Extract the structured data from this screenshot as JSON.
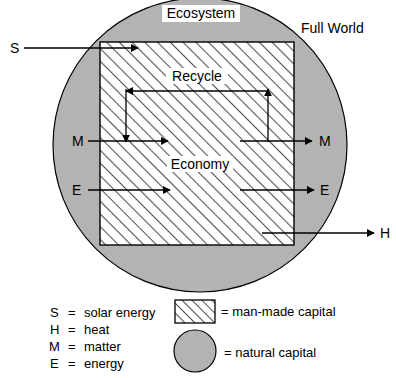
{
  "figure": {
    "labels": {
      "ecosystem": "Ecosystem",
      "full_world": "Full World",
      "recycle": "Recycle",
      "economy": "Economy"
    },
    "flows": [
      {
        "id": "solar",
        "symbol": "S",
        "side": "left-in"
      },
      {
        "id": "matter-in",
        "symbol": "M",
        "side": "left-in"
      },
      {
        "id": "matter-out",
        "symbol": "M",
        "side": "right-out"
      },
      {
        "id": "energy-in",
        "symbol": "E",
        "side": "left-in"
      },
      {
        "id": "energy-out",
        "symbol": "E",
        "side": "right-out"
      },
      {
        "id": "heat",
        "symbol": "H",
        "side": "right-out"
      }
    ],
    "flow_symbols": {
      "s": "S",
      "m_left": "M",
      "m_right": "M",
      "e_left": "E",
      "e_right": "E",
      "h": "H"
    }
  },
  "legend": {
    "abbreviations": [
      {
        "symbol": "S",
        "eq": "=",
        "meaning": "solar energy"
      },
      {
        "symbol": "H",
        "eq": "=",
        "meaning": "heat"
      },
      {
        "symbol": "M",
        "eq": "=",
        "meaning": "matter"
      },
      {
        "symbol": "E",
        "eq": "=",
        "meaning": "energy"
      }
    ],
    "swatches": [
      {
        "id": "man-made",
        "eq_label": "= man-made capital",
        "fill": "hatched"
      },
      {
        "id": "natural",
        "eq_label": "= natural capital",
        "fill": "gray"
      }
    ]
  },
  "colors": {
    "natural_capital_gray": "#b3b3b3",
    "stroke": "#000000",
    "hatch_line": "#4d4d4d",
    "man_made_bg": "#ffffff"
  }
}
